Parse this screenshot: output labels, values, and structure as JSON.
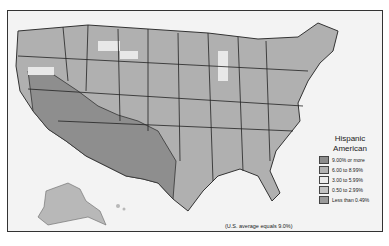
{
  "map": {
    "title": "Hispanic American",
    "note": "(U.S. average equals 9.0%)",
    "legend": [
      {
        "label": "9.00% or more",
        "color": "#8c8c8c"
      },
      {
        "label": "6.00 to 8.99%",
        "color": "#b3b3b3"
      },
      {
        "label": "3.00 to 5.99%",
        "color": "#ececec"
      },
      {
        "label": "0.50 to 2.99%",
        "color": "#c2c2c2"
      },
      {
        "label": "Less than 0.49%",
        "color": "#9a9a9a"
      }
    ]
  }
}
